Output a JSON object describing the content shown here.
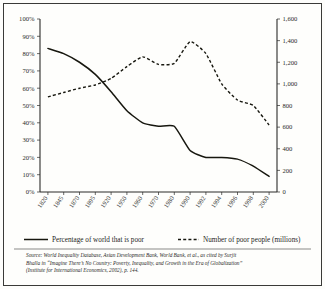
{
  "figure": {
    "background_color": "#fefefc",
    "frame_color": "#3a3a38",
    "ink_color": "#17170f"
  },
  "legend": {
    "position": "bottom",
    "entries": [
      {
        "label": "Percentage of world that is poor",
        "style": "solid",
        "axis": "left"
      },
      {
        "label": "Number of poor people (millions)",
        "style": "dashed",
        "axis": "right"
      }
    ]
  },
  "source": {
    "line1": "Source: World Inequality Database, Asian Development Bank, World Bank, et al., as cited by Surjit",
    "line2": "Bhalla in “Imagine There’s No Country: Poverty, Inequality, and Growth in the Era of Globalization”",
    "line3": "(Institute for International Economics, 2002), p. 144."
  },
  "chart_data": {
    "type": "line",
    "title": "",
    "subtitle": "",
    "xlabel": "",
    "ylabel": "Percentage of world that is poor",
    "y2label": "Number of poor people (millions)",
    "grid": false,
    "legend_position": "bottom",
    "categories": [
      "1820",
      "1845",
      "1870",
      "1895",
      "1920",
      "1950",
      "1960",
      "1970",
      "1980",
      "1990",
      "1992",
      "1994",
      "1996",
      "1998",
      "2000"
    ],
    "x": [
      1820,
      1845,
      1870,
      1895,
      1920,
      1950,
      1960,
      1970,
      1980,
      1990,
      1992,
      1994,
      1996,
      1998,
      2000
    ],
    "ylim": [
      0,
      100
    ],
    "yticks": [
      "0%",
      "10%",
      "20%",
      "30%",
      "40%",
      "50%",
      "60%",
      "70%",
      "80%",
      "90%",
      "100%"
    ],
    "ytick_values": [
      0,
      10,
      20,
      30,
      40,
      50,
      60,
      70,
      80,
      90,
      100
    ],
    "y2lim": [
      0,
      1600
    ],
    "y2ticks": [
      "0",
      "200",
      "400",
      "600",
      "800",
      "1,000",
      "1,200",
      "1,400",
      "1,600"
    ],
    "y2tick_values": [
      0,
      200,
      400,
      600,
      800,
      1000,
      1200,
      1400,
      1600
    ],
    "series": [
      {
        "name": "Percentage of world that is poor",
        "style": "solid",
        "axis": "left",
        "unit": "%",
        "values": [
          83,
          80,
          75,
          68,
          58,
          47,
          40,
          38,
          38,
          24,
          20,
          20,
          19,
          15,
          9
        ]
      },
      {
        "name": "Number of poor people (millions)",
        "style": "dashed",
        "axis": "right",
        "unit": "millions",
        "values": [
          880,
          920,
          960,
          990,
          1050,
          1160,
          1250,
          1180,
          1190,
          1390,
          1280,
          1000,
          850,
          800,
          620
        ]
      }
    ]
  }
}
